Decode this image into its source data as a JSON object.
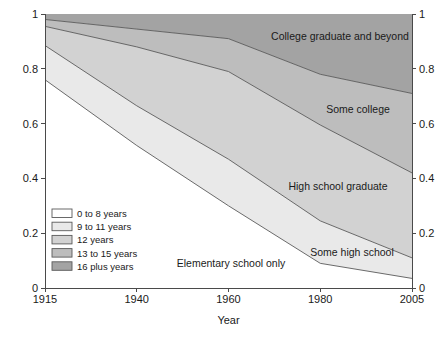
{
  "chart_data": {
    "type": "area",
    "title": "",
    "xlabel": "Year",
    "ylabel": "",
    "stacked": true,
    "normalized": true,
    "grid": false,
    "legend_position": "inside-bottom-left",
    "x": [
      1915,
      1940,
      1960,
      1980,
      2005
    ],
    "xtick_labels": [
      "1915",
      "1940",
      "1960",
      "1980",
      "2005"
    ],
    "ylim": [
      0,
      1
    ],
    "ytick_labels_left": [
      "0",
      "0.2",
      "0.4",
      "0.6",
      "0.8",
      "1"
    ],
    "ytick_labels_right": [
      "0",
      "0.2",
      "0.4",
      "0.6",
      "0.8",
      "1"
    ],
    "ytick_values": [
      0,
      0.2,
      0.4,
      0.6,
      0.8,
      1
    ],
    "series": [
      {
        "name": "0 to 8 years",
        "area_label": "Elementary school only",
        "color": "#ffffff",
        "values": [
          0.76,
          0.52,
          0.3,
          0.09,
          0.035
        ],
        "cumulative": [
          0.76,
          0.52,
          0.3,
          0.09,
          0.035
        ]
      },
      {
        "name": "9 to 11 years",
        "area_label": "Some high school",
        "color": "#e9e9e9",
        "values": [
          0.125,
          0.145,
          0.17,
          0.155,
          0.075
        ],
        "cumulative": [
          0.885,
          0.665,
          0.47,
          0.245,
          0.11
        ]
      },
      {
        "name": "12 years",
        "area_label": "High school graduate",
        "color": "#d2d2d2",
        "values": [
          0.07,
          0.215,
          0.32,
          0.35,
          0.31
        ],
        "cumulative": [
          0.955,
          0.88,
          0.79,
          0.595,
          0.42
        ]
      },
      {
        "name": "13 to 15 years",
        "area_label": "Some college",
        "color": "#bdbdbd",
        "values": [
          0.025,
          0.065,
          0.12,
          0.185,
          0.29
        ],
        "cumulative": [
          0.98,
          0.945,
          0.91,
          0.78,
          0.71
        ]
      },
      {
        "name": "16 plus years",
        "area_label": "College graduate and beyond",
        "color": "#a3a3a3",
        "values": [
          0.02,
          0.055,
          0.09,
          0.22,
          0.29
        ],
        "cumulative": [
          1.0,
          1.0,
          1.0,
          1.0,
          1.0
        ]
      }
    ],
    "legend_entries": [
      "0 to 8 years",
      "9 to 11 years",
      "12 years",
      "13 to 15 years",
      "16 plus years"
    ],
    "area_annotations": [
      "College graduate and beyond",
      "Some college",
      "High school graduate",
      "Some high school",
      "Elementary school only"
    ]
  }
}
